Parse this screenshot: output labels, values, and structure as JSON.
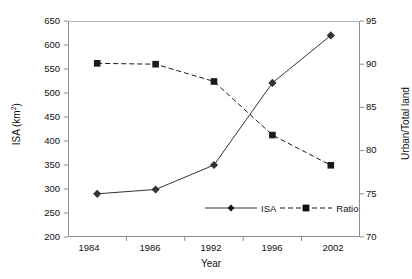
{
  "chart_data": {
    "type": "line",
    "title": "",
    "xlabel": "Year",
    "ylabel": "ISA (km2)",
    "ylabel_right": "Urban/Total land",
    "categories": [
      "1984",
      "1986",
      "1992",
      "1996",
      "2002"
    ],
    "series": [
      {
        "name": "ISA",
        "axis": "left",
        "marker": "diamond",
        "line_style": "solid",
        "color": "#333333",
        "values": [
          290,
          299,
          350,
          521,
          620
        ]
      },
      {
        "name": "Ratio",
        "axis": "right",
        "marker": "square",
        "line_style": "dashed",
        "color": "#1a1a1a",
        "values": [
          90.1,
          90.0,
          88.0,
          81.8,
          78.3
        ]
      }
    ],
    "ylim": [
      200,
      650
    ],
    "ylim_right": [
      70,
      95
    ],
    "yticks": [
      200,
      250,
      300,
      350,
      400,
      450,
      500,
      550,
      600,
      650
    ],
    "yticks_right": [
      70,
      75,
      80,
      85,
      90,
      95
    ],
    "grid": false,
    "legend_position": "inside-bottom-center"
  },
  "axes": {
    "left_ticks": [
      "650",
      "600",
      "550",
      "500",
      "450",
      "400",
      "350",
      "300",
      "250",
      "200"
    ],
    "right_ticks": [
      "95",
      "90",
      "85",
      "80",
      "75",
      "70"
    ],
    "x_ticks": [
      "1984",
      "1986",
      "1992",
      "1996",
      "2002"
    ],
    "x_title": "Year",
    "y_title_main": "ISA (km",
    "y_title_sup": "2",
    "y_title_tail": ")",
    "y_title_right": "Urban/Total land"
  },
  "legend": {
    "items": [
      {
        "label": "ISA"
      },
      {
        "label": "Ratio"
      }
    ]
  }
}
